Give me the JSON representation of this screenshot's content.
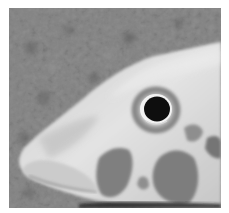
{
  "image": {
    "alt": "Grayscale close-up photograph of a fish head resting on gravel",
    "subject": "fish head",
    "background": "gravel substrate",
    "color_mode": "grayscale",
    "colors": {
      "background_gravel": "#777777",
      "gravel_dark": "#5e5e5e",
      "fish_body_light": "#d9d9d9",
      "fish_body_mid": "#b8b8b8",
      "fish_blotch": "#7c7c7c",
      "eye_ring": "#8a8a8a",
      "pupil": "#050505",
      "frame": "#ffffff"
    }
  }
}
